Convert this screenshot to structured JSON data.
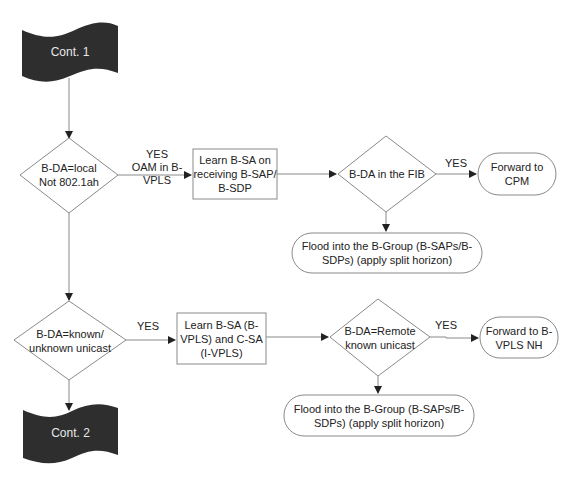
{
  "diagram": {
    "type": "flowchart",
    "colors": {
      "line": "#8a8a8a",
      "arrow": "#222222",
      "connector_fill": "#2e2e2e",
      "connector_text": "#e8e8e8",
      "node_stroke": "#8a8a8a"
    },
    "nodes": {
      "cont1": {
        "shape": "off-page-connector",
        "label": "Cont. 1"
      },
      "d1": {
        "shape": "decision",
        "line1": "B-DA=local",
        "line2": "Not 802.1ah"
      },
      "p1": {
        "shape": "process",
        "line1": "Learn B-SA on",
        "line2": "receiving B-SAP/",
        "line3": "B-SDP"
      },
      "d2": {
        "shape": "decision",
        "label": "B-DA in the FIB"
      },
      "t1": {
        "shape": "terminal",
        "line1": "Forward to",
        "line2": "CPM"
      },
      "t2": {
        "shape": "terminal",
        "line1": "Flood into the B-Group (B-SAPs/B-",
        "line2": "SDPs) (apply split horizon)"
      },
      "d3": {
        "shape": "decision",
        "line1": "B-DA=known/",
        "line2": "unknown unicast"
      },
      "p2": {
        "shape": "process",
        "line1": "Learn B-SA (B-",
        "line2": "VPLS) and C-SA",
        "line3": "(I-VPLS)"
      },
      "d4": {
        "shape": "decision",
        "line1": "B-DA=Remote",
        "line2": "known unicast"
      },
      "t3": {
        "shape": "terminal",
        "line1": "Forward to B-",
        "line2": "VPLS NH"
      },
      "t4": {
        "shape": "terminal",
        "line1": "Flood into the B-Group (B-SAPs/B-",
        "line2": "SDPs) (apply split horizon)"
      },
      "cont2": {
        "shape": "off-page-connector",
        "label": "Cont. 2"
      }
    },
    "edges": [
      {
        "from": "cont1",
        "to": "d1",
        "label": ""
      },
      {
        "from": "d1",
        "to": "p1",
        "label_line1": "YES",
        "label_line2": "OAM in B-VPLS"
      },
      {
        "from": "p1",
        "to": "d2",
        "label": ""
      },
      {
        "from": "d2",
        "to": "t1",
        "label": "YES"
      },
      {
        "from": "d2",
        "to": "t2",
        "label": ""
      },
      {
        "from": "d1",
        "to": "d3",
        "label": ""
      },
      {
        "from": "d3",
        "to": "p2",
        "label": "YES"
      },
      {
        "from": "p2",
        "to": "d4",
        "label": ""
      },
      {
        "from": "d4",
        "to": "t3",
        "label": "YES"
      },
      {
        "from": "d4",
        "to": "t4",
        "label": ""
      },
      {
        "from": "d3",
        "to": "cont2",
        "label": ""
      }
    ]
  }
}
